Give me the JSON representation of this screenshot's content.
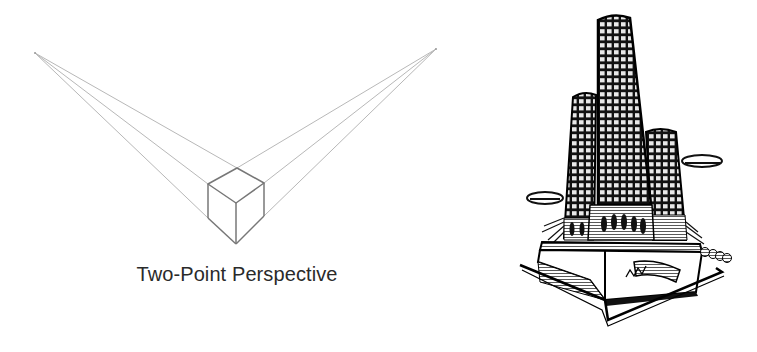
{
  "diagram": {
    "caption": "Two-Point Perspective",
    "vanishing_points": {
      "left": {
        "x": 35,
        "y": 53
      },
      "right": {
        "x": 436,
        "y": 49
      }
    },
    "cube": {
      "top_back": {
        "x": 237,
        "y": 168
      },
      "top_left": {
        "x": 208,
        "y": 184
      },
      "top_front": {
        "x": 236,
        "y": 203
      },
      "top_right": {
        "x": 264,
        "y": 183
      },
      "bottom_left": {
        "x": 208,
        "y": 218
      },
      "bottom_front": {
        "x": 236,
        "y": 244
      },
      "bottom_right": {
        "x": 264,
        "y": 216
      }
    },
    "colors": {
      "guide_line": "#b8b8b8",
      "cube_edge": "#777777",
      "caption": "#2a2a2a"
    }
  },
  "illustration": {
    "subject": "skyscraper-towers-woodcut",
    "description": "Black and white engraved illustration of three cylindrical towers on a podium in perspective"
  }
}
